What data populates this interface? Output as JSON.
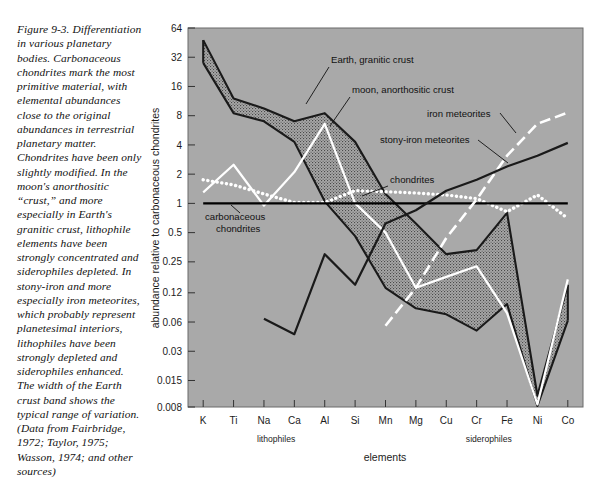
{
  "caption": {
    "text": "Figure 9-3. Differentiation in various planetary bodies. Carbonaceous chondrites mark the most primitive material, with elemental abundances close to the original abundances in terrestrial planetary matter. Chondrites have been only slightly modified. In the moon's anorthositic “crust,” and more especially in Earth's granitic crust, lithophile elements have been strongly concentrated and siderophiles depleted. In stony-iron and more especially iron meteorites, which probably represent planetesimal interiors, lithophiles have been strongly depleted and siderophiles enhanced. The width of the Earth crust band shows the typical range of variation. (Data from Fairbridge, 1972; Taylor, 1975; Wasson, 1974; and other sources)"
  },
  "chart_data": {
    "type": "line",
    "title": "",
    "xlabel": "elements",
    "ylabel": "abundance relative to carbonaceous chondrites",
    "categories": [
      "K",
      "Ti",
      "Na",
      "Ca",
      "Al",
      "Si",
      "Mn",
      "Mg",
      "Cu",
      "Cr",
      "Fe",
      "Ni",
      "Co"
    ],
    "ytick_labels": [
      "64",
      "32",
      "16",
      "8",
      "4",
      "2",
      "1",
      "0.5",
      "0.25",
      "0.12",
      "0.06",
      "0.03",
      "0.015",
      "0.008"
    ],
    "ytick_values": [
      64,
      32,
      16,
      8,
      4,
      2,
      1,
      0.5,
      0.25,
      0.12,
      0.06,
      0.03,
      0.015,
      0.008
    ],
    "ylim": [
      0.008,
      64
    ],
    "yscale": "log",
    "grid": false,
    "legend_position": "inline-annotations",
    "plot_background": "#a9a9a9",
    "groups": [
      {
        "label": "lithophiles",
        "from": "K",
        "to": "Si",
        "center_index": 2.4
      },
      {
        "label": "siderophiles",
        "from": "Cu",
        "to": "Co",
        "center_index": 9.4
      }
    ],
    "series": [
      {
        "name": "Earth, granitic crust",
        "style": "band",
        "color": "#1a1a1a",
        "fill": "stipple-dark",
        "upper": [
          48,
          12.0,
          9.5,
          7.0,
          8.5,
          4.3,
          1.25,
          0.62,
          0.3,
          0.33,
          0.8,
          0.0105,
          0.145
        ],
        "lower": [
          28,
          8.5,
          7.0,
          4.3,
          1.05,
          0.46,
          0.135,
          0.083,
          0.072,
          0.049,
          0.092,
          0.0082,
          0.062
        ]
      },
      {
        "name": "moon, anorthositic crust",
        "style": "solid",
        "color": "#ffffff",
        "values": [
          1.3,
          2.5,
          0.95,
          2.1,
          6.6,
          1.0,
          0.5,
          0.135,
          0.175,
          0.225,
          0.074,
          0.0085,
          0.165
        ]
      },
      {
        "name": "chondrites",
        "style": "dotted",
        "color": "#ffffff",
        "values": [
          1.75,
          1.55,
          1.25,
          1.02,
          1.02,
          1.35,
          1.32,
          1.28,
          1.22,
          1.12,
          0.82,
          1.22,
          0.7
        ]
      },
      {
        "name": "carbonaceous chondrites",
        "style": "reference",
        "color": "#000000",
        "values": [
          1,
          1,
          1,
          1,
          1,
          1,
          1,
          1,
          1,
          1,
          1,
          1,
          1
        ]
      },
      {
        "name": "iron meteorites",
        "style": "dashed",
        "color": "#ffffff",
        "values": [
          null,
          null,
          null,
          null,
          null,
          null,
          0.055,
          0.135,
          0.44,
          1.1,
          3.1,
          6.6,
          8.6
        ]
      },
      {
        "name": "stony-iron meteorites",
        "style": "solid",
        "color": "#1a1a1a",
        "values": [
          null,
          null,
          0.065,
          0.045,
          0.3,
          0.145,
          0.62,
          0.85,
          1.35,
          1.75,
          2.4,
          3.1,
          4.2
        ]
      }
    ],
    "annotations": [
      {
        "id": "ann-earth",
        "label": "Earth, granitic crust",
        "color": "#111111",
        "x": 331,
        "y": 63,
        "leader": [
          [
            329,
            67
          ],
          [
            306,
            104
          ]
        ]
      },
      {
        "id": "ann-moon",
        "label": "moon, anorthositic crust",
        "color": "#111111",
        "x": 352,
        "y": 93,
        "leader": [
          [
            350,
            97
          ],
          [
            330,
            126
          ]
        ]
      },
      {
        "id": "ann-iron",
        "label": "iron meteorites",
        "color": "#111111",
        "x": 427,
        "y": 117,
        "leader": [
          [
            500,
            113
          ],
          [
            516,
            133
          ]
        ]
      },
      {
        "id": "ann-stonyiron",
        "label": "stony-iron meteorites",
        "color": "#111111",
        "x": 380,
        "y": 143,
        "leader": [
          [
            478,
            140
          ],
          [
            508,
            163
          ]
        ]
      },
      {
        "id": "ann-chondrites",
        "label": "chondrites",
        "color": "#111111",
        "x": 390,
        "y": 183,
        "leader": [
          [
            388,
            186
          ],
          [
            362,
            196
          ]
        ]
      },
      {
        "id": "ann-carbon",
        "label": "carbonaceous",
        "color": "#111111",
        "x": 205,
        "y": 220,
        "leader": [
          [
            240,
            213
          ],
          [
            231,
            205
          ]
        ]
      },
      {
        "id": "ann-carbon2",
        "label": "chondrites",
        "color": "#111111",
        "x": 216,
        "y": 232,
        "leader": null
      }
    ]
  },
  "axes": {
    "y_title": "abundance relative to carbonaceous chondrites",
    "x_title": "elements"
  }
}
